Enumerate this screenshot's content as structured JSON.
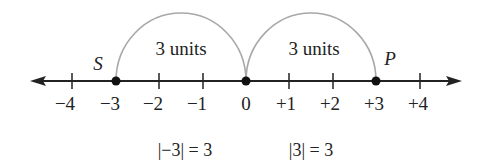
{
  "diagram": {
    "colors": {
      "axis": "#222222",
      "arc": "#a8a8a8",
      "point": "#111111",
      "text": "#222222"
    },
    "number_line": {
      "ticks": [
        {
          "value": -4,
          "label": "−4"
        },
        {
          "value": -3,
          "label": "−3"
        },
        {
          "value": -2,
          "label": "−2"
        },
        {
          "value": -1,
          "label": "−1"
        },
        {
          "value": 0,
          "label": "0"
        },
        {
          "value": 1,
          "label": "+1"
        },
        {
          "value": 2,
          "label": "+2"
        },
        {
          "value": 3,
          "label": "+3"
        },
        {
          "value": 4,
          "label": "+4"
        }
      ],
      "arrows": "both"
    },
    "points": [
      {
        "name": "S",
        "value": -3,
        "label": "S"
      },
      {
        "name": "origin",
        "value": 0,
        "label": ""
      },
      {
        "name": "P",
        "value": 3,
        "label": "P"
      }
    ],
    "arcs": [
      {
        "from": -3,
        "to": 0,
        "label": "3 units"
      },
      {
        "from": 0,
        "to": 3,
        "label": "3 units"
      }
    ],
    "equations": [
      {
        "text": "|−3| = 3"
      },
      {
        "text": "|3| = 3"
      }
    ]
  }
}
